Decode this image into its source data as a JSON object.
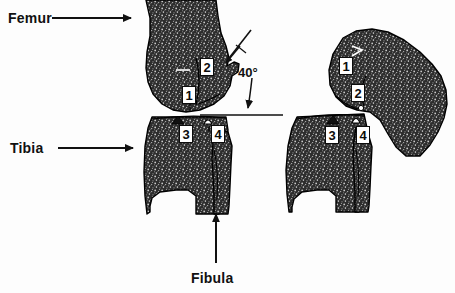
{
  "figure": {
    "background_color": "#fdfdfd",
    "ink_color": "#111111",
    "bone_fill_color": "#2b2b2b",
    "bone_outline_color": "#000000",
    "label_box_fill": "#ffffff"
  },
  "annotations": {
    "femur": {
      "label": "Femur",
      "arrow": "arrow-right"
    },
    "tibia": {
      "label": "Tibia",
      "arrow": "arrow-right"
    },
    "fibula": {
      "label": "Fibula",
      "arrow": "arrow-up"
    },
    "angle": {
      "label": "40°",
      "value": 40,
      "unit": "degrees",
      "arrow": "curved-arrow-down"
    }
  },
  "left_view": {
    "name": "extended-knee-view",
    "markers": [
      {
        "id": "1",
        "label": "1"
      },
      {
        "id": "2",
        "label": "2"
      },
      {
        "id": "3",
        "label": "3"
      },
      {
        "id": "4",
        "label": "4"
      }
    ]
  },
  "right_view": {
    "name": "flexed-knee-view",
    "markers": [
      {
        "id": "1",
        "label": "1"
      },
      {
        "id": "2",
        "label": "2"
      },
      {
        "id": "3",
        "label": "3"
      },
      {
        "id": "4",
        "label": "4"
      }
    ]
  }
}
